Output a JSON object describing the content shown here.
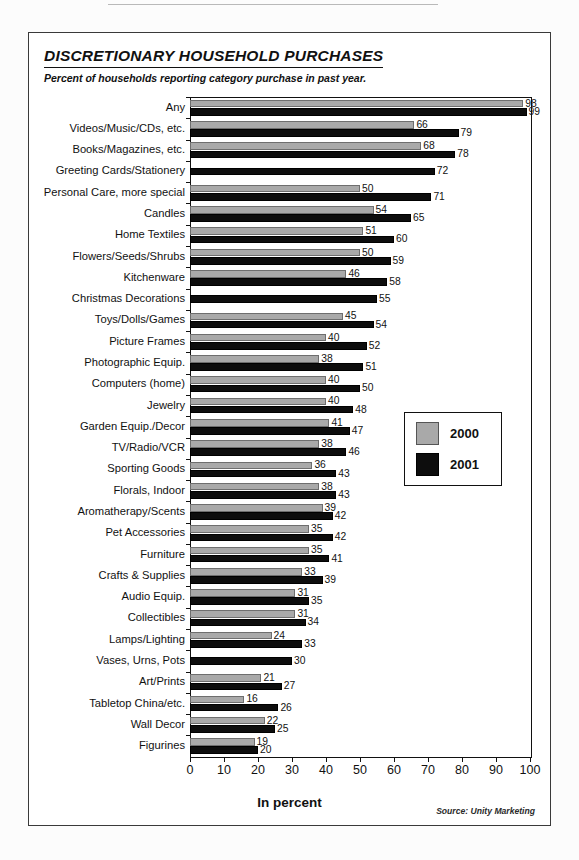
{
  "chart_data": {
    "type": "bar",
    "orientation": "horizontal",
    "title": "DISCRETIONARY HOUSEHOLD PURCHASES",
    "subtitle": "Percent of households reporting category purchase in past year.",
    "xlabel": "In percent",
    "ylabel": "",
    "xlim": [
      0,
      100
    ],
    "xticks": [
      0,
      10,
      20,
      30,
      40,
      50,
      60,
      70,
      80,
      90,
      100
    ],
    "grid": false,
    "legend_position": "middle-right",
    "source": "Source: Unity Marketing",
    "categories": [
      "Any",
      "Videos/Music/CDs, etc.",
      "Books/Magazines, etc.",
      "Greeting Cards/Stationery",
      "Personal Care, more special",
      "Candles",
      "Home Textiles",
      "Flowers/Seeds/Shrubs",
      "Kitchenware",
      "Christmas Decorations",
      "Toys/Dolls/Games",
      "Picture Frames",
      "Photographic Equip.",
      "Computers (home)",
      "Jewelry",
      "Garden Equip./Decor",
      "TV/Radio/VCR",
      "Sporting Goods",
      "Florals, Indoor",
      "Aromatherapy/Scents",
      "Pet Accessories",
      "Furniture",
      "Crafts & Supplies",
      "Audio Equip.",
      "Collectibles",
      "Lamps/Lighting",
      "Vases, Urns, Pots",
      "Art/Prints",
      "Tabletop China/etc.",
      "Wall Decor",
      "Figurines"
    ],
    "series": [
      {
        "name": "2000",
        "color": "#a9a9a9",
        "values": [
          98,
          66,
          68,
          null,
          50,
          54,
          51,
          50,
          46,
          null,
          45,
          40,
          38,
          40,
          40,
          41,
          38,
          36,
          38,
          39,
          35,
          35,
          33,
          31,
          31,
          24,
          null,
          21,
          16,
          22,
          19
        ]
      },
      {
        "name": "2001",
        "color": "#0d0d0d",
        "values": [
          99,
          79,
          78,
          72,
          71,
          65,
          60,
          59,
          58,
          55,
          54,
          52,
          51,
          50,
          48,
          47,
          46,
          43,
          43,
          42,
          42,
          41,
          39,
          35,
          34,
          33,
          30,
          27,
          26,
          25,
          20
        ]
      }
    ]
  },
  "legend": {
    "items": [
      {
        "label": "2000",
        "swatch": "y2000"
      },
      {
        "label": "2001",
        "swatch": "y2001"
      }
    ]
  }
}
